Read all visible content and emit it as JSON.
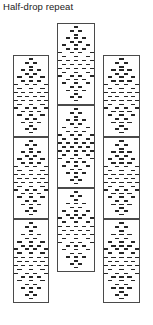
{
  "figure": {
    "caption": "Half-drop repeat",
    "type": "pattern-repeat-diagram",
    "background_color": "#ffffff",
    "border_color": "#4a4a4a",
    "motif_color": "#262626",
    "canvas": {
      "width": 153,
      "height": 325
    }
  },
  "columns": [
    {
      "id": "left-column",
      "name": "left",
      "x": 13,
      "width": 36,
      "offset_label": "0",
      "panels": [
        {
          "id": "left-panel-1",
          "top": 55,
          "height": 82
        },
        {
          "id": "left-panel-2",
          "top": 137,
          "height": 82
        },
        {
          "id": "left-panel-3",
          "top": 219,
          "height": 84
        }
      ]
    },
    {
      "id": "middle-column",
      "name": "middle",
      "x": 57,
      "width": 38,
      "offset_label": "1/2",
      "panels": [
        {
          "id": "middle-panel-1",
          "top": 23,
          "height": 82
        },
        {
          "id": "middle-panel-2",
          "top": 105,
          "height": 83
        },
        {
          "id": "middle-panel-3",
          "top": 188,
          "height": 84
        }
      ]
    },
    {
      "id": "right-column",
      "name": "right",
      "x": 103,
      "width": 37,
      "offset_label": "0",
      "panels": [
        {
          "id": "right-panel-1",
          "top": 55,
          "height": 82
        },
        {
          "id": "right-panel-2",
          "top": 137,
          "height": 82
        },
        {
          "id": "right-panel-3",
          "top": 219,
          "height": 84
        }
      ]
    }
  ],
  "motif": {
    "name": "diamond-dash-motif",
    "description": "diamond arrangement of short horizontal dashes",
    "dash_width": 4.2,
    "dash_height": 1.6,
    "rows": [
      {
        "y": 0.035,
        "xs": [
          0.5
        ]
      },
      {
        "y": 0.085,
        "xs": [
          0.38,
          0.62
        ]
      },
      {
        "y": 0.135,
        "xs": [
          0.5
        ]
      },
      {
        "y": 0.175,
        "xs": [
          0.27,
          0.5,
          0.73
        ]
      },
      {
        "y": 0.225,
        "xs": [
          0.38,
          0.62
        ]
      },
      {
        "y": 0.265,
        "xs": [
          0.16,
          0.5,
          0.84
        ]
      },
      {
        "y": 0.315,
        "xs": [
          0.27,
          0.5,
          0.73
        ]
      },
      {
        "y": 0.355,
        "xs": [
          0.05,
          0.38,
          0.62,
          0.95
        ]
      },
      {
        "y": 0.405,
        "xs": [
          0.16,
          0.5,
          0.84
        ]
      },
      {
        "y": 0.455,
        "xs": [
          0.05,
          0.27,
          0.5,
          0.73,
          0.95
        ]
      },
      {
        "y": 0.505,
        "xs": [
          0.16,
          0.38,
          0.62,
          0.84
        ]
      },
      {
        "y": 0.555,
        "xs": [
          0.05,
          0.27,
          0.5,
          0.73,
          0.95
        ]
      },
      {
        "y": 0.605,
        "xs": [
          0.16,
          0.5,
          0.84
        ]
      },
      {
        "y": 0.65,
        "xs": [
          0.05,
          0.38,
          0.62,
          0.95
        ]
      },
      {
        "y": 0.695,
        "xs": [
          0.27,
          0.5,
          0.73
        ]
      },
      {
        "y": 0.74,
        "xs": [
          0.16,
          0.5,
          0.84
        ]
      },
      {
        "y": 0.785,
        "xs": [
          0.38,
          0.62
        ]
      },
      {
        "y": 0.83,
        "xs": [
          0.27,
          0.5,
          0.73
        ]
      },
      {
        "y": 0.875,
        "xs": [
          0.5
        ]
      },
      {
        "y": 0.915,
        "xs": [
          0.38,
          0.62
        ]
      },
      {
        "y": 0.955,
        "xs": [
          0.5
        ]
      }
    ]
  }
}
